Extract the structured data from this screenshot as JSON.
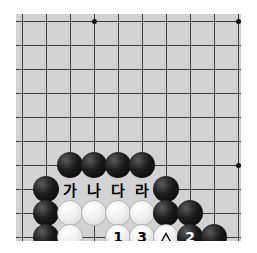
{
  "page": {
    "background_color": "#ffffff",
    "width": 257,
    "height": 253
  },
  "board": {
    "name": "go-board",
    "background_color": "#d2d2d2",
    "line_color": "#3c3c3c",
    "grid_spacing": 24,
    "columns": 10,
    "rows": 10,
    "star_points": [
      {
        "col": 4,
        "row": 1
      },
      {
        "col": 10,
        "row": 1
      },
      {
        "col": 10,
        "row": 7
      }
    ]
  },
  "stones": [
    {
      "id": "b-c3r7",
      "color": "black",
      "col": 3,
      "row": 7,
      "label": ""
    },
    {
      "id": "b-c4r7",
      "color": "black",
      "col": 4,
      "row": 7,
      "label": ""
    },
    {
      "id": "b-c5r7",
      "color": "black",
      "col": 5,
      "row": 7,
      "label": ""
    },
    {
      "id": "b-c6r7",
      "color": "black",
      "col": 6,
      "row": 7,
      "label": ""
    },
    {
      "id": "b-c2r8",
      "color": "black",
      "col": 2,
      "row": 8,
      "label": ""
    },
    {
      "id": "b-c7r8",
      "color": "black",
      "col": 7,
      "row": 8,
      "label": ""
    },
    {
      "id": "b-c2r9",
      "color": "black",
      "col": 2,
      "row": 9,
      "label": ""
    },
    {
      "id": "w-c3r9",
      "color": "white",
      "col": 3,
      "row": 9,
      "label": ""
    },
    {
      "id": "w-c4r9",
      "color": "white",
      "col": 4,
      "row": 9,
      "label": ""
    },
    {
      "id": "w-c5r9",
      "color": "white",
      "col": 5,
      "row": 9,
      "label": ""
    },
    {
      "id": "w-c6r9",
      "color": "white",
      "col": 6,
      "row": 9,
      "label": ""
    },
    {
      "id": "b-c7r9",
      "color": "black",
      "col": 7,
      "row": 9,
      "label": ""
    },
    {
      "id": "b-c8r9",
      "color": "black",
      "col": 8,
      "row": 9,
      "label": ""
    },
    {
      "id": "b-c2r10",
      "color": "black",
      "col": 2,
      "row": 10,
      "label": ""
    },
    {
      "id": "w-c3r10",
      "color": "white",
      "col": 3,
      "row": 10,
      "label": ""
    },
    {
      "id": "w-c5r10",
      "color": "white",
      "col": 5,
      "row": 10,
      "label": "1"
    },
    {
      "id": "w-c6r10",
      "color": "white",
      "col": 6,
      "row": 10,
      "label": "3"
    },
    {
      "id": "w-c7r10",
      "color": "white",
      "col": 7,
      "row": 10,
      "label": "triangle"
    },
    {
      "id": "b-c8r10",
      "color": "black",
      "col": 8,
      "row": 10,
      "label": "2"
    },
    {
      "id": "b-c9r10",
      "color": "black",
      "col": 9,
      "row": 10,
      "label": ""
    }
  ],
  "point_labels": [
    {
      "id": "label-ga",
      "text": "가",
      "col": 3,
      "row": 8
    },
    {
      "id": "label-na",
      "text": "나",
      "col": 4,
      "row": 8
    },
    {
      "id": "label-da",
      "text": "다",
      "col": 5,
      "row": 8
    },
    {
      "id": "label-ra",
      "text": "라",
      "col": 6,
      "row": 8
    }
  ]
}
